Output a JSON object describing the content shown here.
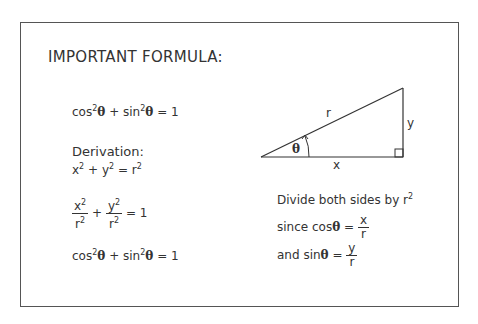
{
  "title": "IMPORTANT FORMULA:",
  "identity": {
    "cos": "cos",
    "sin": "sin",
    "exp": "2",
    "theta": "θ",
    "plus": "+",
    "equals": "= 1"
  },
  "derivation": {
    "heading": "Derivation:",
    "pythag": {
      "x": "x",
      "y": "y",
      "r": "r",
      "exp": "2",
      "plus": "+",
      "eq": "="
    },
    "fraction_step": {
      "num1": "x",
      "num2": "y",
      "den": "r",
      "exp": "2",
      "plus": "+",
      "equals": "= 1"
    },
    "result": {
      "cos": "cos",
      "sin": "sin",
      "exp": "2",
      "theta": "θ",
      "plus": "+",
      "equals": "= 1"
    }
  },
  "triangle": {
    "hypotenuse_label": "r",
    "opposite_label": "y",
    "adjacent_label": "x",
    "angle_label": "θ"
  },
  "notes": {
    "divide": {
      "text": "Divide both sides by r",
      "exp": "2"
    },
    "cos_def": {
      "prefix": "since cos",
      "theta": "θ",
      "eq": "=",
      "num": "x",
      "den": "r"
    },
    "sin_def": {
      "prefix": "and sin",
      "theta": "θ",
      "eq": "=",
      "num": "y",
      "den": "r"
    }
  }
}
